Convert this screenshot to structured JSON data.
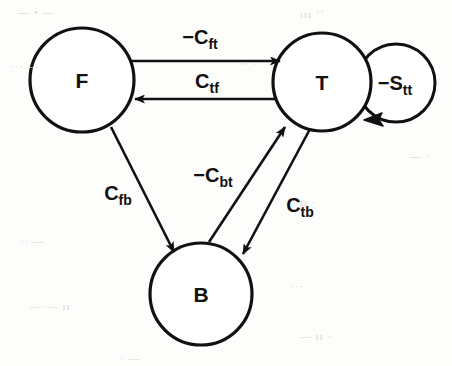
{
  "figure": {
    "type": "directed-graph",
    "title": "",
    "background_color": "#fdfdfb",
    "stroke_color": "#111111",
    "node_fill": "#ffffff"
  },
  "nodes": [
    {
      "id": "F",
      "label": "F",
      "cx": 82,
      "cy": 80,
      "r": 52
    },
    {
      "id": "T",
      "label": "T",
      "cx": 322,
      "cy": 82,
      "r": 49
    },
    {
      "id": "B",
      "label": "B",
      "cx": 201,
      "cy": 294,
      "r": 51
    }
  ],
  "edges": [
    {
      "id": "f-to-t",
      "from": "F",
      "to": "T",
      "label": "−C",
      "sub": "ft",
      "label_x": 200,
      "label_y": 44
    },
    {
      "id": "t-to-f",
      "from": "T",
      "to": "F",
      "label": "C",
      "sub": "tf",
      "label_x": 207,
      "label_y": 88
    },
    {
      "id": "f-to-b",
      "from": "F",
      "to": "B",
      "label": "C",
      "sub": "fb",
      "label_x": 118,
      "label_y": 200
    },
    {
      "id": "b-to-t",
      "from": "B",
      "to": "T",
      "label": "−C",
      "sub": "bt",
      "label_x": 213,
      "label_y": 182
    },
    {
      "id": "t-to-b",
      "from": "T",
      "to": "B",
      "label": "C",
      "sub": "tb",
      "label_x": 300,
      "label_y": 212
    },
    {
      "id": "t-self",
      "from": "T",
      "to": "T",
      "label": "−S",
      "sub": "tt",
      "label_x": 395,
      "label_y": 90
    }
  ],
  "self_loop": {
    "cx": 396,
    "cy": 83,
    "r": 39
  },
  "background_artifacts": [
    {
      "text": "—  • —",
      "x": 18,
      "y": 6
    },
    {
      "text": "ııı   ˚˚",
      "x": 300,
      "y": 8
    },
    {
      "text": "···  —",
      "x": 10,
      "y": 60
    },
    {
      "text": "˚˚  ˚",
      "x": 240,
      "y": 60
    },
    {
      "text": "— ·",
      "x": 410,
      "y": 150
    },
    {
      "text": "·· —",
      "x": 20,
      "y": 235
    },
    {
      "text": "ıı  ·",
      "x": 300,
      "y": 196
    },
    {
      "text": "—·—   ıı",
      "x": 30,
      "y": 300
    },
    {
      "text": "···",
      "x": 290,
      "y": 280
    },
    {
      "text": "— ıı ·",
      "x": 300,
      "y": 330
    },
    {
      "text": "· —",
      "x": 120,
      "y": 352
    }
  ]
}
